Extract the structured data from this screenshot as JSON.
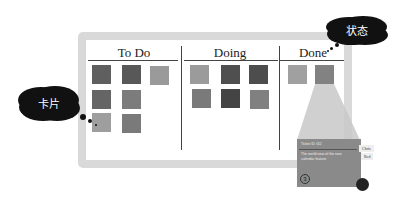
{
  "board": {
    "columns": [
      {
        "title": "To Do",
        "cards": [
          {
            "x": 92,
            "y": 65,
            "color": "#5f5f5f"
          },
          {
            "x": 122,
            "y": 65,
            "color": "#585858"
          },
          {
            "x": 150,
            "y": 66,
            "color": "#9a9a9a"
          },
          {
            "x": 92,
            "y": 90,
            "color": "#656565"
          },
          {
            "x": 122,
            "y": 90,
            "color": "#7c7c7c"
          },
          {
            "x": 92,
            "y": 113,
            "color": "#9e9e9e"
          },
          {
            "x": 122,
            "y": 114,
            "color": "#7a7a7a"
          }
        ]
      },
      {
        "title": "Doing",
        "cards": [
          {
            "x": 190,
            "y": 65,
            "color": "#9b9b9b"
          },
          {
            "x": 221,
            "y": 65,
            "color": "#4f4f4f"
          },
          {
            "x": 249,
            "y": 65,
            "color": "#4d4d4d"
          },
          {
            "x": 192,
            "y": 89,
            "color": "#7a7a7a"
          },
          {
            "x": 221,
            "y": 89,
            "color": "#444444"
          },
          {
            "x": 250,
            "y": 90,
            "color": "#808080"
          }
        ]
      },
      {
        "title": "Done",
        "cards": [
          {
            "x": 288,
            "y": 65,
            "color": "#a0a0a0"
          },
          {
            "x": 315,
            "y": 65,
            "color": "#828282"
          }
        ]
      }
    ]
  },
  "callouts": {
    "card_label": "卡片",
    "status_label": "状态"
  },
  "detail_card": {
    "ticket": "Ticket ID #42",
    "description": "The world view of the new calendar feature",
    "owner": "Chris",
    "status": "Red",
    "number": "3"
  }
}
